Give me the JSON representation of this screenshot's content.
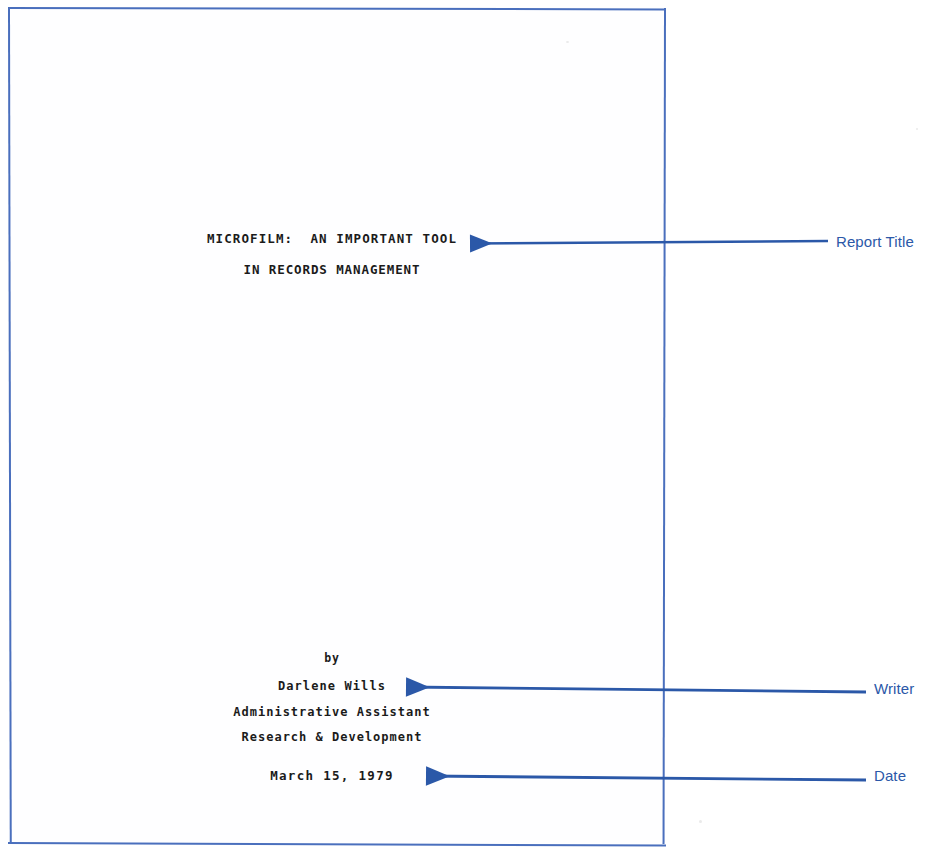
{
  "document": {
    "type": "typewritten-report-title-page",
    "title_line_1": "MICROFILM:  AN IMPORTANT TOOL",
    "title_line_2": "IN RECORDS MANAGEMENT",
    "byline_label": "by",
    "author_name": "Darlene Wills",
    "author_title": "Administrative Assistant",
    "author_department": "Research & Development",
    "date": "March 15, 1979"
  },
  "annotations": {
    "accent_color": "#2b58a8",
    "page_border_color": "#4a6fbd",
    "callouts": [
      {
        "label": "Report Title",
        "points_to": "title_line_1"
      },
      {
        "label": "Writer",
        "points_to": "author_name"
      },
      {
        "label": "Date",
        "points_to": "date"
      }
    ]
  }
}
